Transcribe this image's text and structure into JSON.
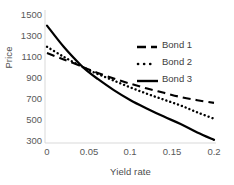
{
  "chart_data": {
    "type": "line",
    "title": "",
    "xlabel": "Yield rate",
    "ylabel": "Price",
    "xlim": [
      0,
      0.2
    ],
    "ylim": [
      300,
      1500
    ],
    "grid": false,
    "legend_position": "upper-right",
    "xticks": [
      "0",
      "0.05",
      "0.1",
      "0.15",
      "0.2"
    ],
    "xtick_values": [
      0,
      0.05,
      0.1,
      0.15,
      0.2
    ],
    "yticks": [
      "1500",
      "1300",
      "1100",
      "900",
      "700",
      "500",
      "300"
    ],
    "ytick_values": [
      1500,
      1300,
      1100,
      900,
      700,
      500,
      300
    ],
    "x": [
      0,
      0.02,
      0.04,
      0.05,
      0.06,
      0.08,
      0.1,
      0.12,
      0.14,
      0.16,
      0.18,
      0.2
    ],
    "series": [
      {
        "name": "Bond 1",
        "style": "dashed",
        "color": "#000000",
        "values": [
          1140,
          1080,
          1020,
          985,
          955,
          900,
          850,
          805,
          765,
          725,
          695,
          670
        ]
      },
      {
        "name": "Bond 2",
        "style": "dotted",
        "color": "#000000",
        "values": [
          1200,
          1105,
          1020,
          980,
          945,
          880,
          815,
          755,
          700,
          645,
          580,
          520
        ]
      },
      {
        "name": "Bond 3",
        "style": "solid",
        "color": "#000000",
        "values": [
          1400,
          1200,
          1030,
          960,
          900,
          790,
          695,
          615,
          540,
          470,
          390,
          320
        ]
      }
    ]
  },
  "legend": {
    "items": [
      {
        "label": "Bond 1",
        "style": "dashed"
      },
      {
        "label": "Bond 2",
        "style": "dotted"
      },
      {
        "label": "Bond 3",
        "style": "solid"
      }
    ]
  }
}
